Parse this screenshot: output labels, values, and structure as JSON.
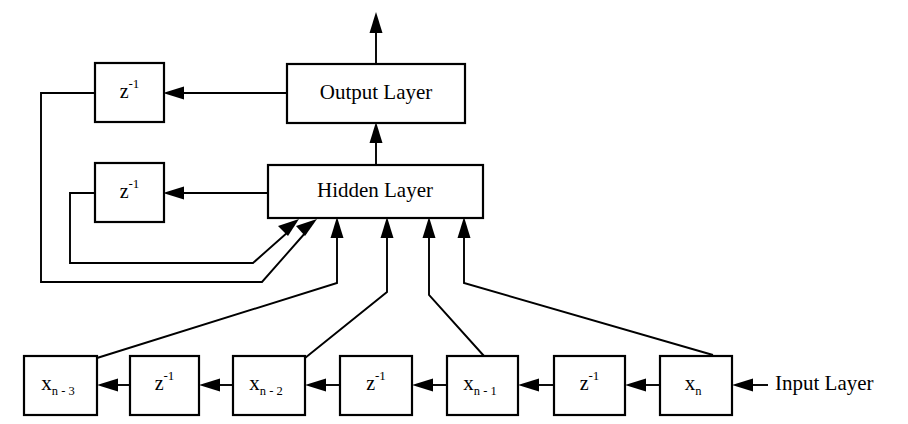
{
  "diagram": {
    "background_color": "#ffffff",
    "line_color": "#000000",
    "text_color": "#000000",
    "blocks": {
      "output_layer": {
        "label": "Output Layer"
      },
      "hidden_layer": {
        "label": "Hidden Layer"
      },
      "delay_output": {
        "base": "z",
        "exponent": "-1"
      },
      "delay_hidden": {
        "base": "z",
        "exponent": "-1"
      },
      "delay_tap_1": {
        "base": "z",
        "exponent": "-1"
      },
      "delay_tap_2": {
        "base": "z",
        "exponent": "-1"
      },
      "delay_tap_3": {
        "base": "z",
        "exponent": "-1"
      },
      "input_xn": {
        "base": "x",
        "subscript": "n"
      },
      "input_xn1": {
        "base": "x",
        "subscript": "n - 1"
      },
      "input_xn2": {
        "base": "x",
        "subscript": "n - 2"
      },
      "input_xn3": {
        "base": "x",
        "subscript": "n - 3"
      }
    },
    "labels": {
      "input_layer": "Input Layer"
    }
  }
}
